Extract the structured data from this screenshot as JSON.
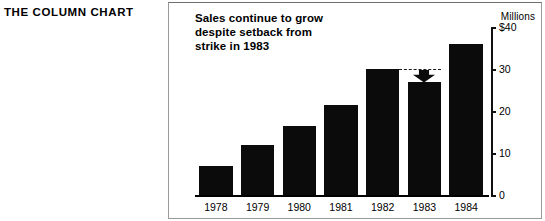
{
  "caption": {
    "text": "THE COLUMN CHART"
  },
  "chart_data": {
    "type": "bar",
    "title": "Sales continue to grow despite setback from strike in 1983",
    "title_lines": [
      "Sales continue to grow",
      "despite setback from",
      "strike in 1983"
    ],
    "units_label": "Millions",
    "xlabel": "",
    "ylabel": "Millions",
    "categories": [
      "1978",
      "1979",
      "1980",
      "1981",
      "1982",
      "1983",
      "1984"
    ],
    "values": [
      7,
      12,
      16.5,
      21.5,
      30,
      27,
      36
    ],
    "ylim": [
      0,
      40
    ],
    "ytick_values": [
      40,
      30,
      20,
      10,
      0
    ],
    "ytick_labels": [
      "$40",
      "30",
      "20",
      "10",
      "0"
    ],
    "grid": false,
    "legend": false,
    "bar_color": "#0b0b0b",
    "annotations": [
      {
        "type": "reference-line",
        "style": "dashed",
        "value": 30,
        "from_category": "1982",
        "to_category": "1983",
        "label": ""
      },
      {
        "type": "arrow",
        "direction": "down",
        "at_category": "1983",
        "from_value": 30,
        "to_value": 27,
        "label": ""
      }
    ]
  }
}
